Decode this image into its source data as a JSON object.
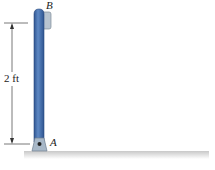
{
  "diagram": {
    "labels": {
      "top_point": "B",
      "bottom_point": "A",
      "dimension": "2 ft"
    },
    "colors": {
      "rod": "#4a74b0",
      "rod_dark": "#2f5590",
      "pin_support": "#a8b8c8",
      "ground_line": "#d8334a",
      "dimension_line": "#333333"
    }
  }
}
